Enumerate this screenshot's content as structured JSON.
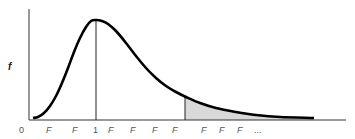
{
  "chart_data": {
    "type": "line",
    "title": "",
    "subtitle": "",
    "xlabel": "",
    "ylabel": "f",
    "x_tick_labels": [
      "0",
      "F",
      "F",
      "1",
      "F",
      "F",
      "F",
      "F",
      "F",
      "F",
      "F",
      "..."
    ],
    "grid": false,
    "legend": null,
    "annotations": [
      {
        "type": "vertical-line",
        "at": "1",
        "label": "mode line at x=1"
      },
      {
        "type": "vertical-line",
        "at": "critical F",
        "label": "critical value line"
      },
      {
        "type": "shaded-region",
        "from": "critical F",
        "to": "end",
        "color": "#d9d9d9"
      }
    ],
    "series": [
      {
        "name": "f(F)",
        "points_px": [
          [
            33,
            118
          ],
          [
            38,
            117
          ],
          [
            44,
            113
          ],
          [
            50,
            106
          ],
          [
            56,
            96
          ],
          [
            62,
            83
          ],
          [
            68,
            68
          ],
          [
            74,
            52
          ],
          [
            80,
            38
          ],
          [
            86,
            27
          ],
          [
            91,
            21
          ],
          [
            96,
            20
          ],
          [
            102,
            21
          ],
          [
            108,
            24
          ],
          [
            116,
            31
          ],
          [
            126,
            43
          ],
          [
            136,
            56
          ],
          [
            146,
            68
          ],
          [
            156,
            78
          ],
          [
            166,
            86
          ],
          [
            176,
            92
          ],
          [
            186,
            97
          ],
          [
            200,
            103
          ],
          [
            216,
            108
          ],
          [
            236,
            112
          ],
          [
            256,
            115
          ],
          [
            280,
            117
          ],
          [
            314,
            118
          ]
        ]
      }
    ],
    "colors": {
      "curve": "#000000",
      "axis": "#333333",
      "shade": "#d9d9d9",
      "tick_text": "#555555"
    }
  }
}
